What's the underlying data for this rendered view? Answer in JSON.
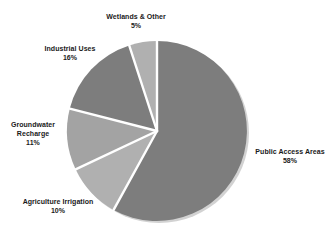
{
  "chart_data": {
    "type": "pie",
    "title": "",
    "subtitle": "",
    "xlabel": "",
    "ylabel": "",
    "legend_position": "none",
    "grid": false,
    "labels_shown": "category name and percentage adjacent to each slice",
    "start_angle_deg": 0,
    "direction": "clockwise",
    "categories": [
      "Public Access Areas",
      "Agriculture Irrigation",
      "Groundwater Recharge",
      "Industrial Uses",
      "Wetlands & Other"
    ],
    "values": [
      58,
      11,
      10,
      16,
      5
    ],
    "units": "percent",
    "total": 100,
    "slices": [
      {
        "name": "Public Access Areas",
        "label": "Public Access Areas",
        "percent": 58,
        "percent_text": "58%",
        "color": "#7d7d7d",
        "start_deg": 0,
        "end_deg": 208.8
      },
      {
        "name": "Agriculture Irrigation",
        "label": "Agriculture Irrigation",
        "percent": 10,
        "percent_text": "10%",
        "color": "#b0b0b0",
        "start_deg": 208.8,
        "end_deg": 244.8
      },
      {
        "name": "Groundwater Recharge",
        "label_line1": "Groundwater",
        "label_line2": "Recharge",
        "percent": 11,
        "percent_text": "11%",
        "color": "#a3a3a3",
        "start_deg": 244.8,
        "end_deg": 284.4
      },
      {
        "name": "Industrial Uses",
        "label": "Industrial Uses",
        "percent": 16,
        "percent_text": "16%",
        "color": "#7d7d7d",
        "start_deg": 284.4,
        "end_deg": 342.0
      },
      {
        "name": "Wetlands & Other",
        "label": "Wetlands & Other",
        "percent": 5,
        "percent_text": "5%",
        "color": "#b0b0b0",
        "start_deg": 342.0,
        "end_deg": 360.0
      }
    ]
  },
  "colors": {
    "background": "#ffffff",
    "text": "#1a1a1a",
    "slice_dark": "#7d7d7d",
    "slice_light": "#b0b0b0",
    "slice_mid": "#a3a3a3",
    "separator": "#ffffff",
    "shadow": "#cfcfcf"
  }
}
